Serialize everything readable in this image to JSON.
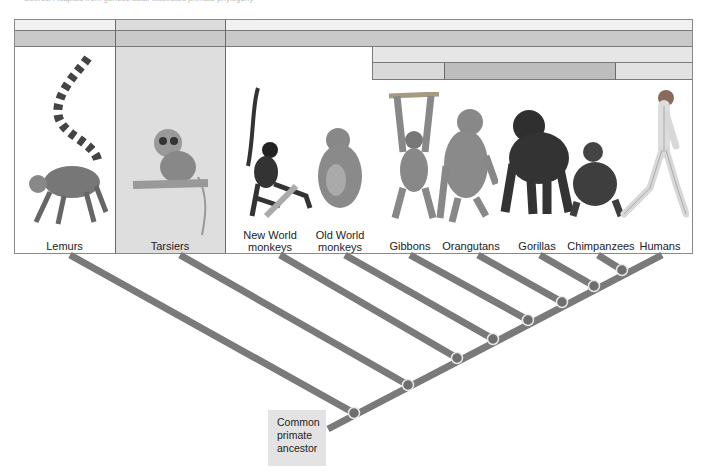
{
  "credit_text": "Source: Adapted from genetic data; illustrated primate phylogeny",
  "diagram": {
    "title": "Primate phylogeny",
    "taxa": [
      {
        "label_lines": [
          "Lemurs"
        ],
        "icon": "lemur-icon"
      },
      {
        "label_lines": [
          "Tarsiers"
        ],
        "icon": "tarsier-icon"
      },
      {
        "label_lines": [
          "New World",
          "monkeys"
        ],
        "icon": "spider-monkey-icon"
      },
      {
        "label_lines": [
          "Old World",
          "monkeys"
        ],
        "icon": "baboon-icon"
      },
      {
        "label_lines": [
          "Gibbons"
        ],
        "icon": "gibbon-icon"
      },
      {
        "label_lines": [
          "Orangutans"
        ],
        "icon": "orangutan-icon"
      },
      {
        "label_lines": [
          "Gorillas"
        ],
        "icon": "gorilla-icon"
      },
      {
        "label_lines": [
          "Chimpanzees"
        ],
        "icon": "chimpanzee-icon"
      },
      {
        "label_lines": [
          "Humans"
        ],
        "icon": "human-icon"
      }
    ],
    "root_label_lines": [
      "Common",
      "primate",
      "ancestor"
    ],
    "colors": {
      "branch": "#7a7a7a",
      "node": "#6e6e6e",
      "band_light": "#ececec",
      "band_mid": "#cfcfcf",
      "band_dark": "#bdbdbd",
      "tarsier_column": "#dedede",
      "ancestor_box": "#e3e3e3"
    }
  }
}
